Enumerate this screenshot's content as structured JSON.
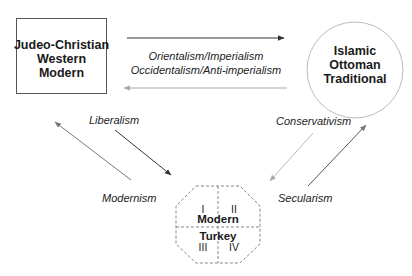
{
  "nodes": {
    "west": {
      "lines": [
        "Judeo-Christian",
        "Western",
        "Modern"
      ]
    },
    "east": {
      "lines": [
        "Islamic",
        "Ottoman",
        "Traditional"
      ]
    },
    "turkey": {
      "title_top": "Modern",
      "title_bottom": "Turkey",
      "quadrants": [
        "I",
        "II",
        "III",
        "IV"
      ]
    }
  },
  "edges": {
    "top_labels": [
      "Orientalism/Imperialism",
      "Occidentalism/Anti-imperialism"
    ],
    "liberalism": "Liberalism",
    "modernism": "Modernism",
    "conservativism": "Conservativism",
    "secularism": "Secularism"
  },
  "colors": {
    "dark_arrow": "#333333",
    "light_arrow": "#aaaaaa",
    "box_border": "#555555",
    "circle_border": "#bbbbbb",
    "dashed": "#888888"
  }
}
